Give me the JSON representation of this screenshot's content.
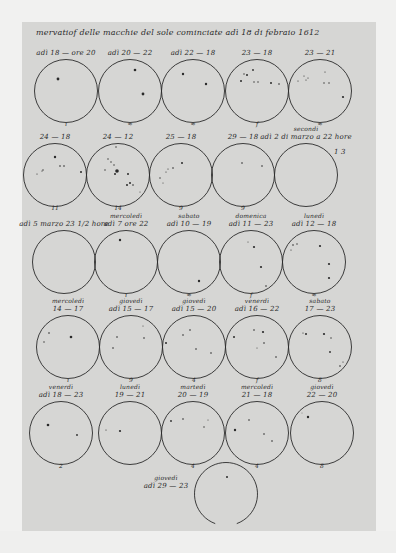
{
  "document": {
    "title": "Osservationi delle macchie del Sole cominciate adì 18 di febraio 1612",
    "heading_visible": "mervatiof delle macchie del sole cominciate adì 18 di febraio 1612"
  },
  "colors": {
    "paper": "#d6d6d4",
    "background": "#f1f1f0",
    "ink": "#2a2a2a"
  },
  "observations": [
    {
      "id": 1,
      "label_line1": "",
      "label_line2": "adì 18 — ore 20",
      "cx": 66,
      "cy": 91,
      "mark": "ı",
      "spots": [
        [
          58,
          79,
          1.4
        ]
      ]
    },
    {
      "id": 2,
      "label_line1": "",
      "label_line2": "adì 20 — 22",
      "cx": 130,
      "cy": 91,
      "mark": "≈",
      "spots": [
        [
          135,
          70,
          1.3
        ],
        [
          143,
          94,
          1.4
        ]
      ]
    },
    {
      "id": 3,
      "label_line1": "",
      "label_line2": "adì 22 — 18",
      "cx": 193,
      "cy": 91,
      "mark": "≈",
      "spots": [
        [
          183,
          74,
          1.2
        ],
        [
          206,
          84,
          1.2
        ]
      ]
    },
    {
      "id": 4,
      "label_line1": "",
      "label_line2": "23 — 18",
      "cx": 257,
      "cy": 91,
      "mark": "f",
      "spots": [
        [
          244,
          74,
          0.7
        ],
        [
          247,
          75,
          1
        ],
        [
          253,
          70,
          0.9
        ],
        [
          241,
          81,
          1
        ],
        [
          254,
          82,
          0.7
        ],
        [
          258,
          82,
          0.7
        ],
        [
          271,
          83,
          1
        ],
        [
          279,
          84,
          0.8
        ]
      ]
    },
    {
      "id": 5,
      "label_line1": "",
      "label_line2": "23 — 21",
      "cx": 320,
      "cy": 91,
      "mark": "≈",
      "spots": [
        [
          325,
          72,
          0.6
        ],
        [
          304,
          76,
          0.6
        ],
        [
          308,
          78,
          0.6
        ],
        [
          306,
          80,
          0.6
        ],
        [
          298,
          81,
          0.6
        ],
        [
          324,
          83,
          0.7
        ],
        [
          329,
          83,
          0.7
        ],
        [
          343,
          97,
          1.1
        ]
      ]
    },
    {
      "id": 6,
      "label_line1": "",
      "label_line2": "24 — 18",
      "cx": 55,
      "cy": 175,
      "mark": "11",
      "spots": [
        [
          55,
          157,
          1.2
        ],
        [
          60,
          166,
          0.8
        ],
        [
          64,
          166,
          0.8
        ],
        [
          43,
          170,
          0.7
        ],
        [
          37,
          174,
          0.6
        ],
        [
          42,
          171,
          0.6
        ],
        [
          81,
          172,
          1
        ]
      ]
    },
    {
      "id": 7,
      "label_line1": "",
      "label_line2": "24 — 12",
      "cx": 118,
      "cy": 175,
      "mark": "14",
      "spots": [
        [
          116,
          147,
          0.7
        ],
        [
          108,
          159,
          0.7
        ],
        [
          111,
          162,
          0.7
        ],
        [
          114,
          165,
          0.7
        ],
        [
          105,
          170,
          0.7
        ],
        [
          117,
          171,
          1.8
        ],
        [
          115,
          174,
          1
        ],
        [
          128,
          174,
          1
        ],
        [
          130,
          183,
          1
        ],
        [
          127,
          185,
          1
        ],
        [
          133,
          185,
          0.8
        ],
        [
          140,
          192,
          0.5
        ]
      ]
    },
    {
      "id": 8,
      "label_line1": "",
      "label_line2": "25 — 18",
      "cx": 181,
      "cy": 175,
      "mark": "9",
      "spots": [
        [
          182,
          163,
          1
        ],
        [
          173,
          168,
          0.8
        ],
        [
          168,
          169,
          0.6
        ],
        [
          166,
          172,
          0.6
        ],
        [
          160,
          178,
          0.7
        ],
        [
          163,
          183,
          0.5
        ]
      ]
    },
    {
      "id": 9,
      "label_line1": "",
      "label_line2": "29 — 18",
      "cx": 243,
      "cy": 175,
      "mark": "9",
      "spots": [
        [
          242,
          163,
          0.8
        ],
        [
          262,
          166,
          0.8
        ]
      ]
    },
    {
      "id": 10,
      "label_line1": "secondi",
      "label_line2": "adì 2 di marzo a 22 hore",
      "cx": 306,
      "cy": 175,
      "mark": "",
      "spots": [],
      "note": "1 3"
    },
    {
      "id": 11,
      "label_line1": "",
      "label_line2": "adì 5 marzo 23 1/2 hore",
      "cx": 64,
      "cy": 262,
      "mark": "",
      "spots": []
    },
    {
      "id": 12,
      "label_line1": "mercoledì",
      "label_line2": "adì 7 ore 22",
      "cx": 126,
      "cy": 262,
      "mark": "ı",
      "spots": [
        [
          120,
          240,
          1.2
        ]
      ]
    },
    {
      "id": 13,
      "label_line1": "sabato",
      "label_line2": "adì 10 — 19",
      "cx": 189,
      "cy": 262,
      "mark": "≈",
      "spots": [
        [
          199,
          281,
          1.2
        ]
      ]
    },
    {
      "id": 14,
      "label_line1": "domenica",
      "label_line2": "adì 11 — 23",
      "cx": 251,
      "cy": 262,
      "mark": "f",
      "spots": [
        [
          254,
          247,
          1.1
        ],
        [
          261,
          267,
          1.1
        ],
        [
          266,
          286,
          0.8
        ],
        [
          248,
          242,
          0.5
        ]
      ]
    },
    {
      "id": 15,
      "label_line1": "lunedì",
      "label_line2": "adì 12 — 18",
      "cx": 314,
      "cy": 262,
      "mark": "≈",
      "spots": [
        [
          293,
          245,
          0.8
        ],
        [
          297,
          244,
          0.7
        ],
        [
          291,
          250,
          0.6
        ],
        [
          320,
          246,
          1.1
        ],
        [
          329,
          264,
          1.1
        ],
        [
          329,
          278,
          1.1
        ]
      ]
    },
    {
      "id": 16,
      "label_line1": "mercoledì",
      "label_line2": "14 — 17",
      "cx": 68,
      "cy": 347,
      "mark": "ı",
      "spots": [
        [
          49,
          333,
          0.8
        ],
        [
          44,
          342,
          0.7
        ],
        [
          71,
          337,
          1.3
        ]
      ]
    },
    {
      "id": 17,
      "label_line1": "giovedì",
      "label_line2": "adì 15 — 17",
      "cx": 131,
      "cy": 347,
      "mark": "9",
      "spots": [
        [
          117,
          337,
          0.8
        ],
        [
          143,
          326,
          0.5
        ],
        [
          144,
          338,
          0.8
        ],
        [
          113,
          348,
          0.8
        ]
      ]
    },
    {
      "id": 18,
      "label_line1": "giovedì",
      "label_line2": "adì 15 — 20",
      "cx": 194,
      "cy": 347,
      "mark": "4",
      "spots": [
        [
          183,
          335,
          0.8
        ],
        [
          190,
          330,
          0.8
        ],
        [
          166,
          343,
          1
        ],
        [
          196,
          349,
          0.8
        ],
        [
          211,
          353,
          0.8
        ]
      ]
    },
    {
      "id": 19,
      "label_line1": "venerdì",
      "label_line2": "adì 16 — 22",
      "cx": 257,
      "cy": 347,
      "mark": "f",
      "spots": [
        [
          234,
          337,
          1
        ],
        [
          254,
          330,
          0.8
        ],
        [
          263,
          332,
          1.1
        ],
        [
          264,
          343,
          0.8
        ],
        [
          257,
          348,
          0.5
        ],
        [
          276,
          357,
          0.8
        ]
      ]
    },
    {
      "id": 20,
      "label_line1": "sabato",
      "label_line2": "17 — 23",
      "cx": 320,
      "cy": 347,
      "mark": "8",
      "spots": [
        [
          306,
          334,
          1
        ],
        [
          303,
          333,
          0.6
        ],
        [
          324,
          334,
          1.1
        ],
        [
          331,
          338,
          0.7
        ],
        [
          330,
          352,
          0.9
        ],
        [
          340,
          366,
          0.8
        ],
        [
          343,
          362,
          0.6
        ]
      ]
    },
    {
      "id": 21,
      "label_line1": "venerdì",
      "label_line2": "adì 18 — 23",
      "cx": 61,
      "cy": 433,
      "mark": "2",
      "spots": [
        [
          48,
          425,
          1.3
        ],
        [
          77,
          435,
          0.9
        ]
      ]
    },
    {
      "id": 22,
      "label_line1": "lunedì",
      "label_line2": "19 — 21",
      "cx": 130,
      "cy": 433,
      "mark": "",
      "spots": [
        [
          106,
          430,
          0.6
        ],
        [
          120,
          431,
          1.1
        ]
      ]
    },
    {
      "id": 23,
      "label_line1": "martedì",
      "label_line2": "20 — 19",
      "cx": 193,
      "cy": 433,
      "mark": "4",
      "spots": [
        [
          171,
          421,
          0.9
        ],
        [
          183,
          419,
          0.8
        ],
        [
          208,
          420,
          0.5
        ],
        [
          204,
          427,
          0.7
        ]
      ]
    },
    {
      "id": 24,
      "label_line1": "mercoledì",
      "label_line2": "21 — 18",
      "cx": 257,
      "cy": 433,
      "mark": "4",
      "spots": [
        [
          249,
          420,
          0.8
        ],
        [
          235,
          430,
          1.2
        ],
        [
          264,
          434,
          0.8
        ],
        [
          272,
          441,
          0.8
        ]
      ]
    },
    {
      "id": 25,
      "label_line1": "giovedì",
      "label_line2": "22 — 20",
      "cx": 322,
      "cy": 433,
      "mark": "8",
      "spots": [
        [
          308,
          417,
          1.2
        ],
        [
          302,
          413,
          0.4
        ]
      ]
    },
    {
      "id": 26,
      "label_line1": "giovedì",
      "label_line2": "adì 29 — 23",
      "cx": 226,
      "cy": 494,
      "mark": "",
      "spots": [
        [
          227,
          477,
          1
        ]
      ],
      "partial": true
    }
  ],
  "notes": {
    "obs10_note": "1 3"
  }
}
